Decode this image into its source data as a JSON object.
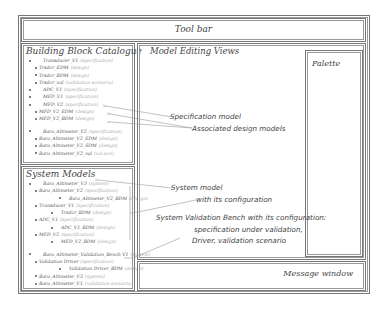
{
  "toolbar": {
    "label": "Tool bar"
  },
  "catalogue": {
    "title": "Building Block Catalogue",
    "items": [
      {
        "indent": 0,
        "name": "Transducer_V1",
        "kind": "(specification)"
      },
      {
        "indent": 1,
        "name": "Trsdcr_EDM",
        "kind": "(design)"
      },
      {
        "indent": 1,
        "name": "Trsdcr_BDM",
        "kind": "(design)"
      },
      {
        "indent": 1,
        "name": "Trsdcr_val",
        "kind": "(validation scenario)"
      },
      {
        "indent": 0,
        "name": "ADC_V1",
        "kind": "(specification)"
      },
      {
        "indent": 0,
        "name": "MFD_V1",
        "kind": "(specification)"
      },
      {
        "indent": 0,
        "name": "MFD_V2",
        "kind": "(specification)"
      },
      {
        "indent": 1,
        "name": "MFD_V2_EDM",
        "kind": "(design)"
      },
      {
        "indent": 1,
        "name": "MFD_V2_BDM",
        "kind": "(design)"
      },
      {
        "indent": 0,
        "name": "Baro_Altimeter_V2",
        "kind": "(specification)",
        "gap": true
      },
      {
        "indent": 1,
        "name": "Baro_Altimeter_V2_EDM",
        "kind": "(design)"
      },
      {
        "indent": 1,
        "name": "Baro_Altimeter_V2_SDM",
        "kind": "(design)"
      },
      {
        "indent": 1,
        "name": "Baro_Altimeter_V2_val",
        "kind": "(val.scn)"
      }
    ]
  },
  "system_models": {
    "title": "System Models",
    "items": [
      {
        "indent": 0,
        "name": "Baro_Altimeter_V3",
        "kind": "(system)"
      },
      {
        "indent": 1,
        "name": "Baro_Altimeter_V2",
        "kind": "(specification)"
      },
      {
        "indent": 3,
        "name": "Baro_Altimeter_V2_BDM",
        "kind": "(design)"
      },
      {
        "indent": 1,
        "name": "Transducer_V1",
        "kind": "(specification)"
      },
      {
        "indent": 2,
        "name": "Trsdcr_BDM",
        "kind": "(design)"
      },
      {
        "indent": 1,
        "name": "ADC_V1",
        "kind": "(specification)"
      },
      {
        "indent": 2,
        "name": "ADC_V1_BDM",
        "kind": "(design)"
      },
      {
        "indent": 1,
        "name": "MFD_V2",
        "kind": "(specification)"
      },
      {
        "indent": 2,
        "name": "MFD_V2_BDM",
        "kind": "(design)"
      },
      {
        "indent": 0,
        "name": "Baro_Altimeter_Validation_Bench V1",
        "kind": "(system)",
        "gap": true
      },
      {
        "indent": 1,
        "name": "Validation Driver",
        "kind": "(specification)"
      },
      {
        "indent": 3,
        "name": "Validation Driver_BDM",
        "kind": "(design)"
      },
      {
        "indent": 1,
        "name": "Baro_Altimeter_V3",
        "kind": "(system)"
      },
      {
        "indent": 1,
        "name": "Baro_Altimeter_V1",
        "kind": "(validation scenario)"
      }
    ]
  },
  "editing_views": {
    "title": "Model Editing Views"
  },
  "palette": {
    "title": "Palette"
  },
  "message_window": {
    "title": "Message window"
  },
  "annotations": {
    "spec_model": "Specification model",
    "design_models": "Associated design models",
    "system_model_1": "System model",
    "system_model_2": "with its configuration",
    "bench_1": "System Validation Bench with its configuration:",
    "bench_2": "specification under validation,",
    "bench_3": "Driver, validation scenario"
  }
}
